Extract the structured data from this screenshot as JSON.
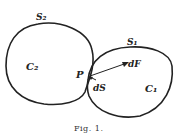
{
  "figure": {
    "caption": "Fig. 1.",
    "labels": {
      "s2": "S₂",
      "s1": "S₁",
      "c2": "C₂",
      "c1": "C₁",
      "p": "P",
      "df": "dF",
      "ds": "dS"
    },
    "colors": {
      "stroke": "#222222",
      "background": "#ffffff"
    }
  }
}
